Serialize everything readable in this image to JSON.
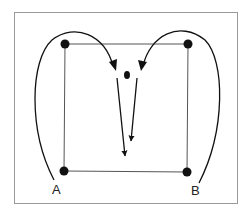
{
  "diagram": {
    "labels": {
      "a": "A",
      "b": "B"
    },
    "colors": {
      "frame": "#9a9a9a",
      "square": "#555555",
      "ink": "#111111",
      "background": "#ffffff"
    },
    "nodes": [
      {
        "id": "top-left",
        "x": 65,
        "y": 44
      },
      {
        "id": "top-right",
        "x": 188,
        "y": 44
      },
      {
        "id": "bottom-left",
        "x": 64,
        "y": 171
      },
      {
        "id": "bottom-right",
        "x": 187,
        "y": 172
      },
      {
        "id": "center",
        "x": 127,
        "y": 75
      }
    ]
  }
}
